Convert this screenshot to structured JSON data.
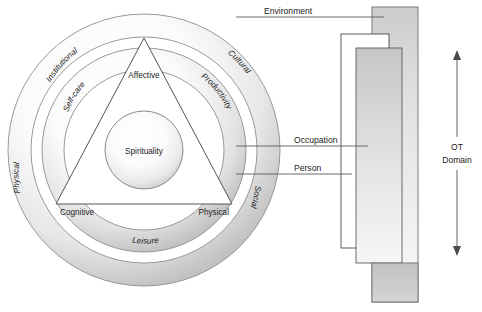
{
  "figure": {
    "caption": ""
  },
  "rings": {
    "outer": {
      "name": "Environment ring",
      "labels": [
        {
          "text": "Institutional",
          "position": "upper-left"
        },
        {
          "text": "Cultural",
          "position": "upper-right"
        },
        {
          "text": "Physical",
          "position": "lower-left"
        },
        {
          "text": "Social",
          "position": "lower-right"
        }
      ]
    },
    "middle": {
      "name": "Occupation ring",
      "labels": [
        {
          "text": "Self-care",
          "position": "upper-left"
        },
        {
          "text": "Productivity",
          "position": "upper-right"
        },
        {
          "text": "Leisure",
          "position": "bottom"
        }
      ]
    },
    "inner": {
      "name": "Person triangle",
      "labels": [
        {
          "text": "Affective",
          "position": "apex-top"
        },
        {
          "text": "Cognitive",
          "position": "bottom-left"
        },
        {
          "text": "Physical",
          "position": "bottom-right"
        }
      ]
    },
    "core": {
      "name": "Spirituality core",
      "label": "Spirituality"
    }
  },
  "callouts": [
    {
      "id": "environment",
      "label": "Environment"
    },
    {
      "id": "occupation",
      "label": "Occupation"
    },
    {
      "id": "person",
      "label": "Person"
    }
  ],
  "scale": {
    "label_line_1": "OT",
    "label_line_2": "Domain",
    "arrow": "double-headed-vertical"
  },
  "colors": {
    "ink": "#1b1b1b",
    "stroke": "#4a4a4a",
    "leader": "#5a5a5a",
    "band_light": "#ffffff",
    "band_shadow": "#9a9a9a",
    "block_fill_top": "#cfcfcf",
    "block_fill_bottom": "#f2f2f2",
    "page": "#ffffff"
  }
}
